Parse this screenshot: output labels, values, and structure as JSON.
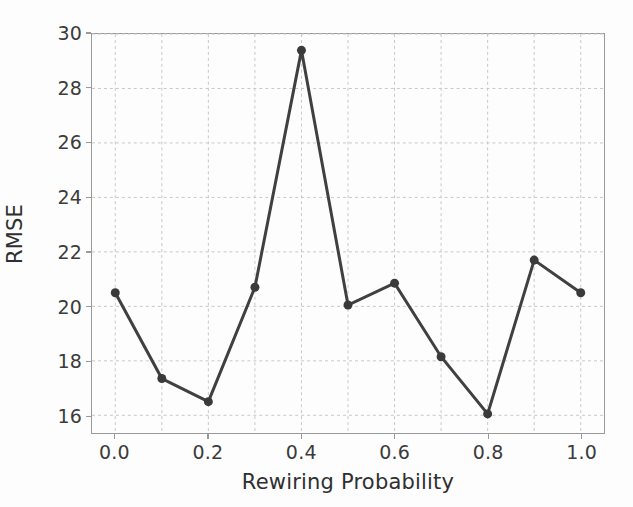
{
  "chart_data": {
    "type": "line",
    "title": "",
    "xlabel": "Rewiring Probability",
    "ylabel": "RMSE",
    "x": [
      0.0,
      0.1,
      0.2,
      0.3,
      0.4,
      0.5,
      0.6,
      0.7,
      0.8,
      0.9,
      1.0
    ],
    "values": [
      20.5,
      17.35,
      16.5,
      20.7,
      29.4,
      20.05,
      20.85,
      18.15,
      16.05,
      21.7,
      20.5
    ],
    "series": [
      {
        "name": "RMSE",
        "values": [
          20.5,
          17.35,
          16.5,
          20.7,
          29.4,
          20.05,
          20.85,
          18.15,
          16.05,
          21.7,
          20.5
        ]
      }
    ],
    "xlim": [
      -0.05,
      1.05
    ],
    "ylim": [
      15.35,
      30.0
    ],
    "xticks": [
      0.0,
      0.2,
      0.4,
      0.6,
      0.8,
      1.0
    ],
    "xtick_labels": [
      "0.0",
      "0.2",
      "0.4",
      "0.6",
      "0.8",
      "1.0"
    ],
    "x_minor_gridlines": [
      0.1,
      0.3,
      0.5,
      0.7,
      0.9
    ],
    "yticks": [
      16,
      18,
      20,
      22,
      24,
      26,
      28,
      30
    ],
    "ytick_labels": [
      "16",
      "18",
      "20",
      "22",
      "24",
      "26",
      "28",
      "30"
    ],
    "grid": true,
    "grid_style": "dashed",
    "grid_color": "#c8c8c8",
    "legend": null,
    "legend_position": "none",
    "marker": "circle",
    "line_color": "#404040",
    "marker_color": "#3a3a3a",
    "line_width": 3,
    "marker_size": 9,
    "background_color": "#fdfdfd",
    "axis_color": "#9a9a9a"
  }
}
